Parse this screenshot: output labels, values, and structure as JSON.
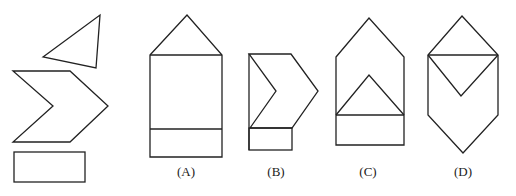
{
  "diagram": {
    "type": "figure-assembly-puzzle",
    "stroke_color": "#222222",
    "background": "#ffffff",
    "pieces": [
      {
        "name": "triangle",
        "points": "43,57 100,15 96,68"
      },
      {
        "name": "chevron",
        "points": "13,71 70,71 108,106 70,142 13,142 53,106"
      },
      {
        "name": "rectangle",
        "x": 14,
        "y": 152,
        "width": 71,
        "height": 30
      }
    ],
    "options": [
      {
        "label": "(A)",
        "label_x": 186,
        "label_y": 176
      },
      {
        "label": "(B)",
        "label_x": 276,
        "label_y": 176
      },
      {
        "label": "(C)",
        "label_x": 368,
        "label_y": 176
      },
      {
        "label": "(D)",
        "label_x": 463,
        "label_y": 176
      }
    ]
  }
}
